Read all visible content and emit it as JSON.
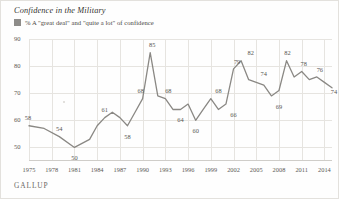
{
  "chart_title": "Confidence in the Military",
  "legend": {
    "swatch_color": "#8e8c89",
    "label": "% A \"great deal\" and \"quite a lot\" of confidence"
  },
  "source": "GALLUP",
  "chart_data": {
    "type": "line",
    "title": "Confidence in the Military",
    "subtitle": "% A \"great deal\" and \"quite a lot\" of confidence",
    "xlabel": "",
    "ylabel": "",
    "ylim": [
      45,
      90
    ],
    "yticks": [
      50,
      60,
      70,
      80,
      90
    ],
    "xlim": [
      1975,
      2015
    ],
    "xticks": [
      1975,
      1978,
      1981,
      1984,
      1987,
      1990,
      1993,
      1996,
      1999,
      2002,
      2005,
      2008,
      2011,
      2014
    ],
    "grid": true,
    "legend_position": "top-left",
    "line_color": "#8a8884",
    "series": [
      {
        "name": "% A \"great deal\" and \"quite a lot\" of confidence",
        "x": [
          1975,
          1977,
          1979,
          1981,
          1983,
          1984,
          1985,
          1986,
          1987,
          1988,
          1989,
          1990,
          1991,
          1992,
          1993,
          1994,
          1995,
          1996,
          1997,
          1998,
          1999,
          2000,
          2001,
          2002,
          2003,
          2004,
          2005,
          2006,
          2007,
          2008,
          2009,
          2010,
          2011,
          2012,
          2013,
          2014,
          2015
        ],
        "values": [
          58,
          57,
          54,
          50,
          53,
          58,
          61,
          63,
          61,
          58,
          63,
          68,
          85,
          69,
          68,
          64,
          64,
          66,
          60,
          64,
          68,
          64,
          66,
          79,
          82,
          75,
          74,
          73,
          69,
          71,
          82,
          76,
          78,
          75,
          76,
          74,
          72
        ]
      }
    ],
    "point_labels": [
      {
        "x": 1975,
        "value": 58
      },
      {
        "x": 1979,
        "value": 54
      },
      {
        "x": 1981,
        "value": 50
      },
      {
        "x": 1985,
        "value": 61
      },
      {
        "x": 1988,
        "value": 58
      },
      {
        "x": 1990,
        "value": 68
      },
      {
        "x": 1991,
        "value": 85
      },
      {
        "x": 1993,
        "value": 68
      },
      {
        "x": 1995,
        "value": 64
      },
      {
        "x": 1997,
        "value": 60
      },
      {
        "x": 2000,
        "value": 68
      },
      {
        "x": 2002,
        "value": 66
      },
      {
        "x": 2003,
        "value": 79
      },
      {
        "x": 2004,
        "value": 82
      },
      {
        "x": 2006,
        "value": 74
      },
      {
        "x": 2008,
        "value": 69
      },
      {
        "x": 2009,
        "value": 82
      },
      {
        "x": 2011,
        "value": 78
      },
      {
        "x": 2013,
        "value": 76
      },
      {
        "x": 2015,
        "value": 74
      }
    ]
  }
}
